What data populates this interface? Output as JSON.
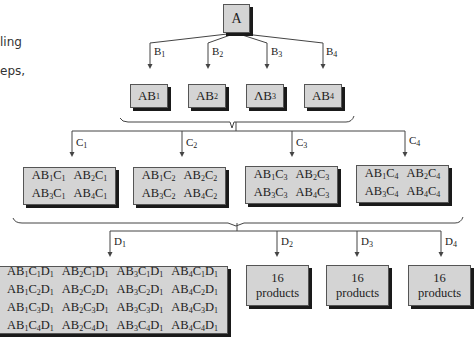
{
  "side_text": [
    "ling",
    "eps,"
  ],
  "root": {
    "label": "A"
  },
  "level1": {
    "branch_labels": [
      [
        "B",
        "1"
      ],
      [
        "B",
        "2"
      ],
      [
        "B",
        "3"
      ],
      [
        "B",
        "4"
      ]
    ],
    "boxes": [
      [
        "AB",
        "1"
      ],
      [
        "AB",
        "2"
      ],
      [
        "ΛB",
        "3"
      ],
      [
        "AB",
        "4"
      ]
    ]
  },
  "level2": {
    "branch_labels": [
      [
        "C",
        "1"
      ],
      [
        "C",
        "2"
      ],
      [
        "C",
        "3"
      ],
      [
        "C",
        "4"
      ]
    ],
    "boxes": [
      [
        [
          "AB",
          "1",
          "C",
          "1"
        ],
        [
          "AB",
          "2",
          "C",
          "1"
        ],
        [
          "AB",
          "3",
          "C",
          "1"
        ],
        [
          "AB",
          "4",
          "C",
          "1"
        ]
      ],
      [
        [
          "AB",
          "1",
          "C",
          "2"
        ],
        [
          "AB",
          "2",
          "C",
          "2"
        ],
        [
          "AB",
          "3",
          "C",
          "2"
        ],
        [
          "AB",
          "4",
          "C",
          "2"
        ]
      ],
      [
        [
          "AB",
          "1",
          "C",
          "3"
        ],
        [
          "AB",
          "2",
          "C",
          "3"
        ],
        [
          "AB",
          "3",
          "C",
          "3"
        ],
        [
          "AB",
          "4",
          "C",
          "3"
        ]
      ],
      [
        [
          "AB",
          "1",
          "C",
          "4"
        ],
        [
          "AB",
          "2",
          "C",
          "4"
        ],
        [
          "AB",
          "3",
          "C",
          "4"
        ],
        [
          "AB",
          "4",
          "C",
          "4"
        ]
      ]
    ]
  },
  "level3": {
    "branch_labels": [
      [
        "D",
        "1"
      ],
      [
        "D",
        "2"
      ],
      [
        "D",
        "3"
      ],
      [
        "D",
        "4"
      ]
    ],
    "expanded_box": [
      [
        "AB1C1D1",
        "AB2C1D1",
        "AB3C1D1",
        "AB4C1D1"
      ],
      [
        "AB1C2D1",
        "AB2C2D1",
        "AB3C2D1",
        "AB4C2D1"
      ],
      [
        "AB1C3D1",
        "AB2C3D1",
        "AB3C3D1",
        "AB4C3D1"
      ],
      [
        "AB1C4D1",
        "AB2C4D1",
        "AB3C4D1",
        "AB4C4D1"
      ]
    ],
    "collapsed_boxes": [
      {
        "count": "16",
        "unit": "products"
      },
      {
        "count": "16",
        "unit": "products"
      },
      {
        "count": "16",
        "unit": "products"
      }
    ]
  },
  "colors": {
    "box_fill": "#d4d4d4",
    "shadow": "#1a1a1a",
    "line": "#444444"
  }
}
